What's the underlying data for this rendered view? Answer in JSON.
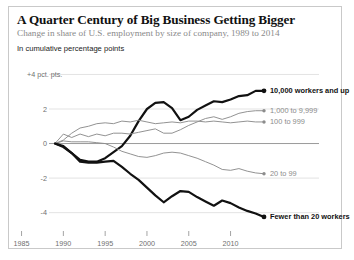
{
  "header": {
    "title": "A Quarter Century of Big Business Getting Bigger",
    "subtitle": "Change in share of U.S. employment by size of company, 1989 to 2014",
    "axis_note": "In cumulative percentage points"
  },
  "colors": {
    "emphasis": "#111111",
    "muted": "#8c8c8c",
    "gridline": "#dcdcdc",
    "zeroline": "#9a9a9a",
    "border": "#c9c9c9",
    "background": "#ffffff"
  },
  "chart_data": {
    "type": "line",
    "title": "A Quarter Century of Big Business Getting Bigger",
    "subtitle": "Change in share of U.S. employment by size of company, 1989 to 2014",
    "xlabel": "",
    "ylabel": "In cumulative percentage points",
    "xlim": [
      1989,
      2014
    ],
    "ylim": [
      -4.6,
      4.2
    ],
    "grid": true,
    "legend_position": "right-inline-labels",
    "y_ticks": [
      4,
      2,
      0,
      -2,
      -4
    ],
    "y_tick_labels": [
      "+4  pct. pts.",
      "2",
      "0",
      "-2",
      "-4"
    ],
    "x_ticks": [
      1985,
      1990,
      1995,
      2000,
      2005,
      2010
    ],
    "x_tick_labels": [
      "1985",
      "1990",
      "1995",
      "2000",
      "2005",
      "2010"
    ],
    "x": [
      1989,
      1990,
      1991,
      1992,
      1993,
      1994,
      1995,
      1996,
      1997,
      1998,
      1999,
      2000,
      2001,
      2002,
      2003,
      2004,
      2005,
      2006,
      2007,
      2008,
      2009,
      2010,
      2011,
      2012,
      2013,
      2014
    ],
    "series": [
      {
        "name": "10,000 workers and up",
        "label": "10,000 workers and up",
        "emphasis": true,
        "color": "#111111",
        "end_value": 3.05,
        "values": [
          0.0,
          -0.15,
          -0.55,
          -0.95,
          -1.05,
          -1.05,
          -0.85,
          -0.5,
          -0.15,
          0.45,
          1.3,
          2.0,
          2.35,
          2.4,
          2.05,
          1.35,
          1.55,
          1.95,
          2.2,
          2.45,
          2.4,
          2.55,
          2.75,
          2.8,
          3.05,
          3.05
        ]
      },
      {
        "name": "1,000 to 9,999",
        "label": "1,000 to 9,999",
        "emphasis": false,
        "color": "#8c8c8c",
        "end_value": 1.9,
        "values": [
          0.0,
          0.55,
          0.35,
          0.55,
          0.4,
          0.55,
          0.45,
          0.6,
          0.6,
          0.55,
          0.65,
          0.75,
          0.85,
          0.6,
          0.6,
          0.8,
          1.05,
          1.25,
          1.45,
          1.55,
          1.4,
          1.55,
          1.75,
          1.85,
          1.9,
          1.9
        ]
      },
      {
        "name": "100 to 999",
        "label": "100 to 999",
        "emphasis": false,
        "color": "#8c8c8c",
        "end_value": 1.25,
        "values": [
          0.0,
          0.2,
          0.6,
          0.9,
          1.0,
          1.15,
          1.2,
          1.15,
          1.3,
          1.25,
          1.35,
          1.25,
          1.15,
          1.2,
          1.25,
          1.2,
          1.3,
          1.3,
          1.25,
          1.3,
          1.25,
          1.2,
          1.25,
          1.3,
          1.25,
          1.25
        ]
      },
      {
        "name": "20 to 99",
        "label": "20 to 99",
        "emphasis": false,
        "color": "#8c8c8c",
        "end_value": -1.75,
        "values": [
          0.0,
          0.15,
          0.1,
          0.1,
          0.1,
          0.05,
          0.0,
          -0.2,
          -0.45,
          -0.6,
          -0.75,
          -0.8,
          -0.7,
          -0.55,
          -0.5,
          -0.55,
          -0.7,
          -0.85,
          -1.05,
          -1.25,
          -1.5,
          -1.55,
          -1.45,
          -1.6,
          -1.7,
          -1.75
        ]
      },
      {
        "name": "Fewer than 20 workers",
        "label": "Fewer than 20 workers",
        "emphasis": true,
        "color": "#111111",
        "end_value": -4.25,
        "values": [
          0.0,
          -0.2,
          -0.55,
          -1.05,
          -1.1,
          -1.1,
          -1.05,
          -1.0,
          -1.35,
          -1.75,
          -2.1,
          -2.55,
          -3.0,
          -3.4,
          -3.05,
          -2.75,
          -2.8,
          -3.1,
          -3.35,
          -3.6,
          -3.3,
          -3.45,
          -3.7,
          -3.9,
          -4.05,
          -4.25
        ]
      }
    ]
  }
}
